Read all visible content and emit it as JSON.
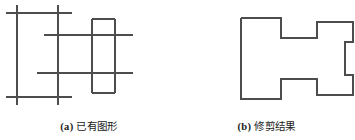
{
  "figure": {
    "type": "line-drawing-comparison",
    "stroke_color": "#4d4d4d",
    "background_color": "#ffffff",
    "stroke_width": 1.4,
    "panels": [
      {
        "id": "a",
        "caption_tag": "(a)",
        "caption_text": "已有图形",
        "description": "已有图形 — overlapping unclipped line segments and rectangles"
      },
      {
        "id": "b",
        "caption_tag": "(b)",
        "caption_text": "修剪结果",
        "description": "修剪结果 — trimmed cross-shaped closed polygon outline"
      }
    ]
  },
  "chart_data": {
    "type": "line",
    "title": "",
    "xlabel": "",
    "ylabel": "",
    "panel_a": {
      "name": "已有图形",
      "segments": [
        {
          "name": "h-line-top",
          "x1": 6,
          "y1": 13,
          "x2": 72,
          "y2": 13
        },
        {
          "name": "h-line-upper-mid",
          "x1": 44,
          "y1": 35,
          "x2": 133,
          "y2": 35
        },
        {
          "name": "h-line-lower-mid",
          "x1": 37,
          "y1": 73,
          "x2": 133,
          "y2": 73
        },
        {
          "name": "h-line-bottom",
          "x1": 6,
          "y1": 97,
          "x2": 72,
          "y2": 97
        },
        {
          "name": "v-line-left",
          "x1": 17,
          "y1": 5,
          "x2": 17,
          "y2": 105
        },
        {
          "name": "v-line-second",
          "x1": 58,
          "y1": 5,
          "x2": 58,
          "y2": 105
        },
        {
          "name": "v-line-rect-left",
          "x1": 92,
          "y1": 19,
          "x2": 92,
          "y2": 93
        },
        {
          "name": "v-line-rect-right",
          "x1": 115,
          "y1": 19,
          "x2": 115,
          "y2": 93
        },
        {
          "name": "h-rect-top",
          "x1": 92,
          "y1": 19,
          "x2": 115,
          "y2": 19
        },
        {
          "name": "h-rect-bottom",
          "x1": 92,
          "y1": 93,
          "x2": 115,
          "y2": 93
        }
      ]
    },
    "panel_b": {
      "name": "修剪结果",
      "polygon": [
        [
          241,
          18
        ],
        [
          281,
          18
        ],
        [
          281,
          38
        ],
        [
          317,
          38
        ],
        [
          317,
          22
        ],
        [
          353,
          22
        ],
        [
          353,
          42
        ],
        [
          345,
          42
        ],
        [
          345,
          75
        ],
        [
          353,
          75
        ],
        [
          353,
          95
        ],
        [
          317,
          95
        ],
        [
          317,
          79
        ],
        [
          281,
          79
        ],
        [
          281,
          99
        ],
        [
          241,
          99
        ]
      ]
    }
  }
}
